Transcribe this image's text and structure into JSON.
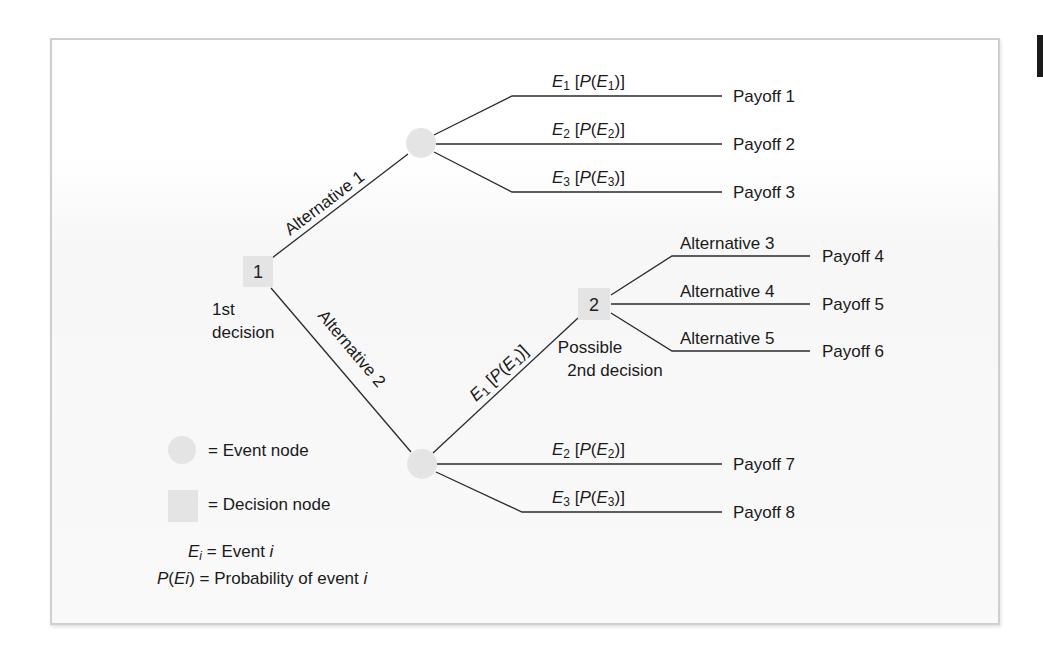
{
  "diagram": {
    "type": "decision-tree",
    "colors": {
      "node_fill": "#e4e4e4",
      "line": "#2a2a2a",
      "frame_border": "#cfcfcf",
      "text": "#1a1a1a"
    },
    "decision_nodes": [
      {
        "id": "1",
        "label": "1",
        "caption_line1": "1st",
        "caption_line2": "decision"
      },
      {
        "id": "2",
        "label": "2",
        "caption_line1": "Possible",
        "caption_line2": "2nd decision"
      }
    ],
    "alternatives": {
      "alt1": "Alternative 1",
      "alt2": "Alternative 2",
      "alt3": "Alternative 3",
      "alt4": "Alternative 4",
      "alt5": "Alternative 5"
    },
    "upper_event_branches": [
      {
        "event": "E",
        "sub": "1",
        "prob_open": " [",
        "prob_p": "P",
        "prob_paren": "(",
        "prob_close": ")]",
        "payoff": "Payoff 1"
      },
      {
        "event": "E",
        "sub": "2",
        "prob_open": " [",
        "prob_p": "P",
        "prob_paren": "(",
        "prob_close": ")]",
        "payoff": "Payoff 2"
      },
      {
        "event": "E",
        "sub": "3",
        "prob_open": " [",
        "prob_p": "P",
        "prob_paren": "(",
        "prob_close": ")]",
        "payoff": "Payoff 3"
      }
    ],
    "second_decision_payoffs": [
      "Payoff 4",
      "Payoff 5",
      "Payoff 6"
    ],
    "lower_event_branches": [
      {
        "event": "E",
        "sub": "1",
        "prob_open": " [",
        "prob_p": "P",
        "prob_paren": "(",
        "prob_close": ")]",
        "leads_to": "2"
      },
      {
        "event": "E",
        "sub": "2",
        "prob_open": " [",
        "prob_p": "P",
        "prob_paren": "(",
        "prob_close": ")]",
        "payoff": "Payoff 7"
      },
      {
        "event": "E",
        "sub": "3",
        "prob_open": " [",
        "prob_p": "P",
        "prob_paren": "(",
        "prob_close": ")]",
        "payoff": "Payoff 8"
      }
    ],
    "legend": {
      "event_node": "= Event node",
      "decision_node": "= Decision node",
      "ei_symbol": "E",
      "ei_sub": "i",
      "ei_text": " = Event ",
      "ei_var": "i",
      "pei_p": "P",
      "pei_open": "(",
      "pei_e": "Ei",
      "pei_close": ")",
      "pei_text": " = Probability of event ",
      "pei_var": "i"
    }
  }
}
